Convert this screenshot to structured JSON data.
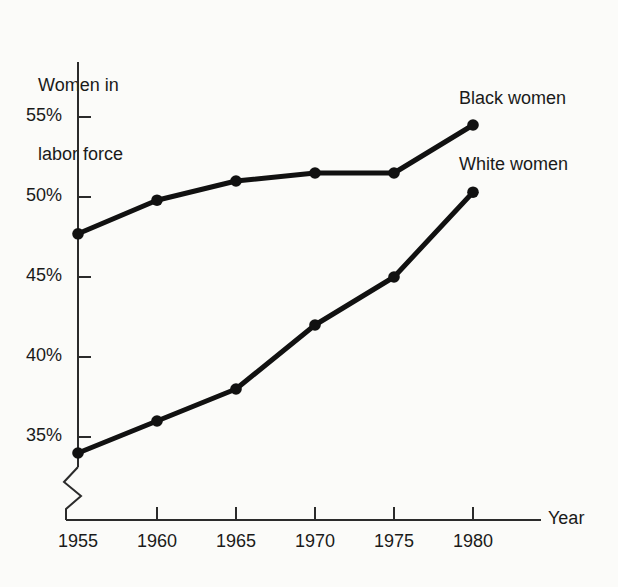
{
  "chart_data": {
    "type": "line",
    "title": "",
    "ylabel": "Women in\nlabor force",
    "xlabel": "Year",
    "categories": [
      1955,
      1960,
      1965,
      1970,
      1975,
      1980
    ],
    "xticklabels": [
      "1955",
      "1960",
      "1965",
      "1970",
      "1975",
      "1980"
    ],
    "yticklabels": [
      "55%",
      "50%",
      "45%",
      "40%",
      "35%"
    ],
    "yticks": [
      55,
      50,
      45,
      40,
      35
    ],
    "ylim": [
      32.5,
      56.5
    ],
    "xlim": [
      1955,
      1982
    ],
    "grid": false,
    "legend_position": "inline-right",
    "axis_break": "x-axis origin zigzag break",
    "marker": "filled-circle",
    "line_color": "#111111",
    "series": [
      {
        "name": "Black women",
        "values": [
          47.7,
          49.8,
          51.0,
          51.5,
          51.5,
          54.5
        ]
      },
      {
        "name": "White women",
        "values": [
          34.0,
          36.0,
          38.0,
          42.0,
          45.0,
          50.3
        ]
      }
    ]
  },
  "axes": {
    "y_title": "Women in\nlabor force",
    "y_title_line1": "Women in",
    "y_title_line2": "labor force",
    "x_title": "Year"
  },
  "annotations": {
    "black_women": "Black women",
    "white_women": "White women"
  }
}
